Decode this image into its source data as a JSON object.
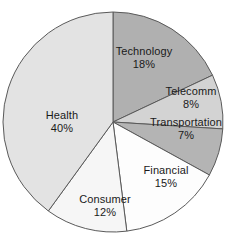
{
  "chart_data": {
    "type": "pie",
    "title": "",
    "xlabel": "",
    "ylabel": "",
    "legend_position": "none",
    "labels_inside_slices": true,
    "value_unit": "%",
    "start_angle_deg": 0,
    "direction": "clockwise",
    "categories": [
      "Technology",
      "Telecomm",
      "Transportation",
      "Financial",
      "Consumer",
      "Health"
    ],
    "values": [
      18,
      8,
      7,
      15,
      12,
      40
    ],
    "total": 100,
    "slices": [
      {
        "name": "Technology",
        "name_text": "Technology",
        "value": 18,
        "value_text": "18%",
        "color": "#b0b0b0",
        "label_x": 144,
        "label_y": 57
      },
      {
        "name": "Telecomm",
        "name_text": "Telecomm",
        "value": 8,
        "value_text": "8%",
        "color": "#d3d3d3",
        "label_x": 191,
        "label_y": 97
      },
      {
        "name": "Transportation",
        "name_text": "Transportation",
        "value": 7,
        "value_text": "7%",
        "color": "#b4b4b4",
        "label_x": 186,
        "label_y": 128
      },
      {
        "name": "Financial",
        "name_text": "Financial",
        "value": 15,
        "value_text": "15%",
        "color": "#fdfdfd",
        "label_x": 166,
        "label_y": 176
      },
      {
        "name": "Consumer",
        "name_text": "Consumer",
        "value": 12,
        "value_text": "12%",
        "color": "#f6f6f6",
        "label_x": 105,
        "label_y": 205
      },
      {
        "name": "Health",
        "name_text": "Health",
        "value": 40,
        "value_text": "40%",
        "color": "#e3e3e3",
        "label_x": 62,
        "label_y": 121
      }
    ],
    "geometry": {
      "center_x": 113,
      "center_y": 122,
      "radius": 110
    },
    "style": {
      "background": "#ffffff",
      "stroke_color": "#5a5a5a",
      "stroke_width": 1,
      "label_color": "#1a1a1a"
    }
  }
}
